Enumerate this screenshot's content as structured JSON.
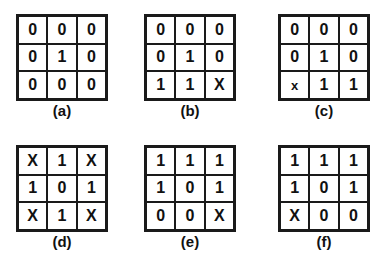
{
  "panels": [
    {
      "id": "a",
      "label": "(a)",
      "cells": [
        "0",
        "0",
        "0",
        "0",
        "1",
        "0",
        "0",
        "0",
        "0"
      ]
    },
    {
      "id": "b",
      "label": "(b)",
      "cells": [
        "0",
        "0",
        "0",
        "0",
        "1",
        "0",
        "1",
        "1",
        "X"
      ]
    },
    {
      "id": "c",
      "label": "(c)",
      "cells": [
        "0",
        "0",
        "0",
        "0",
        "1",
        "0",
        "x",
        "1",
        "1"
      ]
    },
    {
      "id": "d",
      "label": "(d)",
      "cells": [
        "X",
        "1",
        "X",
        "1",
        "0",
        "1",
        "X",
        "1",
        "X"
      ]
    },
    {
      "id": "e",
      "label": "(e)",
      "cells": [
        "1",
        "1",
        "1",
        "1",
        "0",
        "1",
        "0",
        "0",
        "X"
      ]
    },
    {
      "id": "f",
      "label": "(f)",
      "cells": [
        "1",
        "1",
        "1",
        "1",
        "0",
        "1",
        "X",
        "0",
        "0"
      ]
    }
  ]
}
